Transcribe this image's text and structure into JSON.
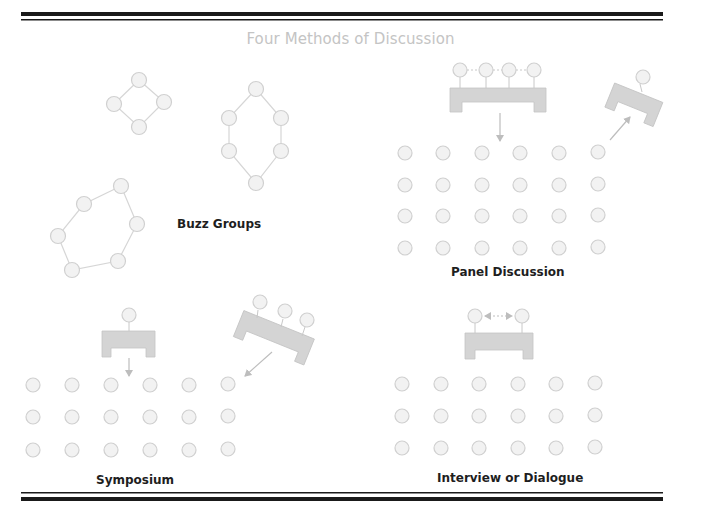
{
  "title": "Four Methods of Discussion",
  "colors": {
    "rule": "#1a1a1a",
    "circle_fill": "#f2f2f2",
    "circle_stroke": "#d0d0d0",
    "connector": "#d6d6d6",
    "table_fill": "#d4d4d4",
    "arrow": "#bdbdbd",
    "title": "#c4c4c4",
    "label": "#1e1e1e"
  },
  "sections": [
    {
      "id": "buzz-groups",
      "label": "Buzz Groups",
      "groups": [
        {
          "members": 4,
          "shape": "diamond"
        },
        {
          "members": 6,
          "shape": "hexagon-vertical"
        },
        {
          "members": 6,
          "shape": "hexagon-tilted"
        }
      ]
    },
    {
      "id": "panel-discussion",
      "label": "Panel Discussion",
      "panel_members": 4,
      "moderator": 1,
      "audience_rows": 4,
      "audience_cols": 6
    },
    {
      "id": "symposium",
      "label": "Symposium",
      "chair": 1,
      "speakers": 3,
      "audience_rows": 3,
      "audience_cols": 6
    },
    {
      "id": "interview-dialogue",
      "label": "Interview or Dialogue",
      "participants": 2,
      "audience_rows": 3,
      "audience_cols": 6
    }
  ]
}
